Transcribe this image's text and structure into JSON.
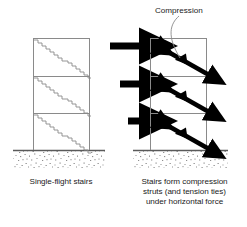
{
  "figure": {
    "title_label": "Compression",
    "captions": {
      "left": "Single-flight stairs",
      "right": "Stairs form compression\nstruts (and tension ties)\nunder horizontal force"
    },
    "colors": {
      "frame_line": "#8a8a8a",
      "stair_line": "#8a8a8a",
      "arrow": "#000000",
      "ground_line": "#5a5a5a",
      "ground_stipple": "#9a9a9a",
      "leader_line": "#8a8a8a",
      "text": "#1a1a1a",
      "background": "#ffffff"
    },
    "left_frame": {
      "name": "single-flight-stairs-frame",
      "x": 33,
      "y": 38,
      "width": 57,
      "height": 112,
      "stories": 3,
      "floor_lines_y": [
        76,
        113
      ],
      "stair_type": "stepped-diagonal-with-landing"
    },
    "right_frame": {
      "name": "compression-strut-frame",
      "x": 150,
      "y": 38,
      "width": 57,
      "height": 112,
      "stories": 3,
      "floor_lines_y": [
        76,
        113
      ],
      "strut_type": "double-headed-diagonal-arrow"
    },
    "force_arrows": [
      {
        "label": "horizontal-force-top",
        "y": 46,
        "x_start": 110,
        "x_end": 149,
        "weight": 7
      },
      {
        "label": "horizontal-force-middle",
        "y": 84,
        "x_start": 120,
        "x_end": 149,
        "weight": 7
      },
      {
        "label": "horizontal-force-bottom",
        "y": 121,
        "x_start": 127,
        "x_end": 149,
        "weight": 7
      }
    ],
    "strut_arrows": [
      {
        "label": "compression-strut-top",
        "x1": 155,
        "y1": 45,
        "x2": 210,
        "y2": 76
      },
      {
        "label": "compression-strut-middle",
        "x1": 155,
        "y1": 82,
        "x2": 210,
        "y2": 113
      },
      {
        "label": "compression-strut-bottom",
        "x1": 155,
        "y1": 119,
        "x2": 210,
        "y2": 150
      }
    ],
    "ground": [
      {
        "label": "ground-left",
        "x": 13,
        "y": 150,
        "width": 92,
        "height": 19
      },
      {
        "label": "ground-right",
        "x": 133,
        "y": 150,
        "width": 95,
        "height": 19
      }
    ],
    "leader": {
      "label": "compression-leader-line",
      "from_x": 178,
      "from_y": 16,
      "to_x": 183,
      "to_y": 58
    }
  }
}
